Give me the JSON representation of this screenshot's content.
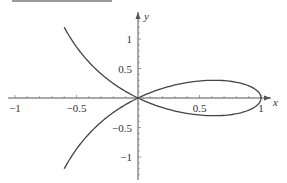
{
  "header_rule": {
    "color": "#9a9a9a"
  },
  "chart_data": {
    "type": "line",
    "title": "",
    "curve": "strophoid y^2 = x^2 (1 - x) / (1 + x)",
    "xlabel": "x",
    "ylabel": "y",
    "xlim": [
      -1.0,
      1.05
    ],
    "ylim": [
      -1.25,
      1.35
    ],
    "grid": false,
    "legend": null,
    "xticks": [
      {
        "value": -1,
        "label": "−1"
      },
      {
        "value": -0.5,
        "label": "−0.5"
      },
      {
        "value": 0.5,
        "label": "0.5"
      },
      {
        "value": 1,
        "label": "1"
      }
    ],
    "yticks": [
      {
        "value": 1,
        "label": "1"
      },
      {
        "value": 0.5,
        "label": "0.5"
      },
      {
        "value": -0.5,
        "label": "−0.5"
      },
      {
        "value": -1,
        "label": "−1"
      }
    ],
    "minor_tick_step": 0.1,
    "series": [
      {
        "name": "strophoid",
        "color": "#444444",
        "x": [
          -0.6,
          -0.5077,
          -0.3846,
          -0.2195,
          -0.1034,
          0.0,
          0.1163,
          0.28,
          0.4483,
          0.6,
          0.7241,
          0.8824,
          0.9692,
          1.0,
          0.9692,
          0.8824,
          0.7241,
          0.6,
          0.4483,
          0.28,
          0.1163,
          0.0,
          -0.1034,
          -0.2195,
          -0.3846,
          -0.5077,
          -0.6
        ],
        "y": [
          1.2,
          0.8885,
          0.5769,
          0.2744,
          0.1163,
          0.0,
          -0.1018,
          -0.21,
          -0.2802,
          -0.3,
          -0.2715,
          -0.2206,
          -0.1211,
          0.0,
          0.1211,
          0.2206,
          0.2715,
          0.3,
          0.2802,
          0.21,
          0.1018,
          0.0,
          -0.1163,
          -0.2744,
          -0.5769,
          -0.8885,
          -1.2
        ]
      }
    ]
  }
}
